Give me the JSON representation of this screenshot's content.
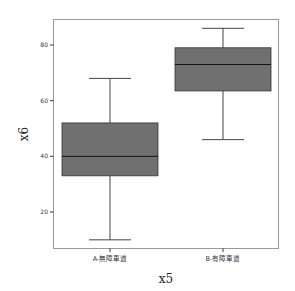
{
  "chart_data": {
    "type": "boxplot",
    "title": "",
    "xlabel": "x5",
    "ylabel": "x6",
    "categories": [
      "A-無障車道",
      "B-有障車道"
    ],
    "series": [
      {
        "name": "A-無障車道",
        "min": 10,
        "q1": 33,
        "median": 40,
        "q3": 52,
        "max": 68
      },
      {
        "name": "B-有障車道",
        "min": 46,
        "q1": 63.5,
        "median": 73,
        "q3": 79,
        "max": 86
      }
    ],
    "yticks": [
      20,
      40,
      60,
      80
    ],
    "ylim": [
      7,
      92
    ],
    "grid": false,
    "legend": "none",
    "colors": {
      "box_fill": "#707070",
      "box_stroke": "#333333",
      "frame": "#999999"
    }
  }
}
